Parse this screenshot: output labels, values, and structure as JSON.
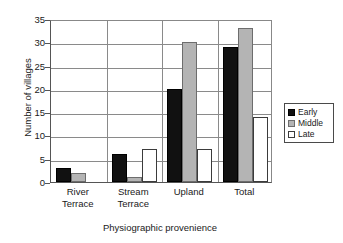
{
  "chart_data": {
    "type": "bar",
    "title": "",
    "subtitle": "",
    "xlabel": "Physiographic provenience",
    "ylabel": "Number of villages",
    "categories": [
      "River Terrace",
      "Stream Terrace",
      "Upland",
      "Total"
    ],
    "category_lines": [
      [
        "River",
        "Terrace"
      ],
      [
        "Stream",
        "Terrace"
      ],
      [
        "Upland"
      ],
      [
        "Total"
      ]
    ],
    "series": [
      {
        "name": "Early",
        "color": "#111111",
        "values": [
          3,
          2,
          20,
          29
        ]
      },
      {
        "name": "Middle",
        "color": "#b4b4b4",
        "values": [
          2,
          1,
          30,
          33
        ]
      },
      {
        "name": "Late",
        "color": "#ffffff",
        "values": [
          0,
          7,
          7,
          14
        ]
      }
    ],
    "series_values": {
      "Early": [
        3,
        6,
        20,
        29
      ],
      "Middle": [
        2,
        1,
        30,
        33
      ],
      "Late": [
        0,
        7,
        7,
        14
      ]
    },
    "ylim": [
      0,
      35
    ],
    "ytick_step": 5,
    "yticks": [
      0,
      5,
      10,
      15,
      20,
      25,
      30,
      35
    ],
    "ytick_labels": [
      "0",
      "5",
      "10",
      "15",
      "20",
      "25",
      "30",
      "35"
    ],
    "grid": true,
    "grid_axis": "y",
    "legend_position": "right",
    "legend_entries": [
      "Early",
      "Middle",
      "Late"
    ]
  }
}
